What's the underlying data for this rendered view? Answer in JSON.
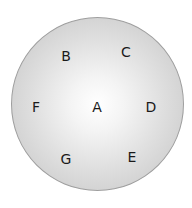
{
  "diagram": {
    "shape": "circle",
    "fill_center": "#ffffff",
    "fill_edge": "#c4c4c4",
    "outline": "#9e9e9e",
    "labels": [
      {
        "id": "A",
        "text": "A",
        "x": 97,
        "y": 107
      },
      {
        "id": "B",
        "text": "B",
        "x": 66,
        "y": 56
      },
      {
        "id": "C",
        "text": "C",
        "x": 126,
        "y": 52
      },
      {
        "id": "D",
        "text": "D",
        "x": 151,
        "y": 107
      },
      {
        "id": "E",
        "text": "E",
        "x": 132,
        "y": 157
      },
      {
        "id": "F",
        "text": "F",
        "x": 36,
        "y": 107
      },
      {
        "id": "G",
        "text": "G",
        "x": 66,
        "y": 159
      }
    ]
  }
}
